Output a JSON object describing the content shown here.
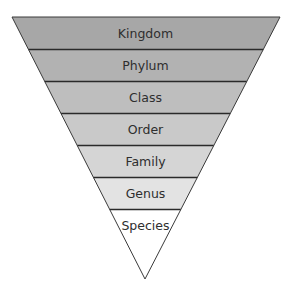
{
  "diagram": {
    "type": "inverted-pyramid",
    "title": "",
    "levels": [
      {
        "label": "Kingdom",
        "fill": "#a7a7a7"
      },
      {
        "label": "Phylum",
        "fill": "#b2b2b2"
      },
      {
        "label": "Class",
        "fill": "#bebebe"
      },
      {
        "label": "Order",
        "fill": "#c9c9c9"
      },
      {
        "label": "Family",
        "fill": "#d5d5d5"
      },
      {
        "label": "Genus",
        "fill": "#e3e3e3"
      },
      {
        "label": "Species",
        "fill": "#ffffff"
      }
    ],
    "colors": {
      "outline": "#3a3a3a",
      "divider": "#2a2a2a",
      "text": "#2e2e2e"
    }
  }
}
